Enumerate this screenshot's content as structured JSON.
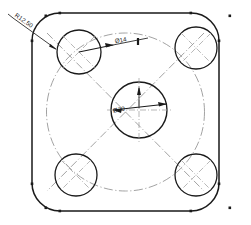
{
  "drawing": {
    "title": "Square plate with four corner holes",
    "view": "top-view",
    "line_colors": {
      "outline": "#1a1a1a",
      "centerline": "#8a8a8a",
      "dimension": "#1a1a1a",
      "background": "#ffffff"
    },
    "dimensions": [
      {
        "id": "corner-radius",
        "label": "R12.50",
        "type": "radius",
        "target": "rounded-corner",
        "leader_angle_deg": 45
      },
      {
        "id": "corner-hole-diameter",
        "label": "Ø14",
        "type": "diameter",
        "target": "corner-hole",
        "leader_angle_deg": 0
      },
      {
        "id": "center-hole-diameter",
        "label": "Ø30",
        "type": "diameter",
        "target": "center-hole",
        "leader_angle_deg": 0
      }
    ],
    "features": {
      "plate": {
        "name": "square-plate",
        "corner_radius": 12.5
      },
      "corner_holes": {
        "name": "corner-hole",
        "count": 4,
        "diameter": 14,
        "positions": [
          "top-left",
          "top-right",
          "bottom-left",
          "bottom-right"
        ]
      },
      "center_hole": {
        "name": "center-hole",
        "count": 1,
        "diameter": 30
      },
      "bolt_circle": {
        "name": "bolt-circle",
        "style": "dash-dot"
      }
    },
    "markers": {
      "node_dot_count": 12,
      "tick_mark_label": "center-tick"
    }
  }
}
